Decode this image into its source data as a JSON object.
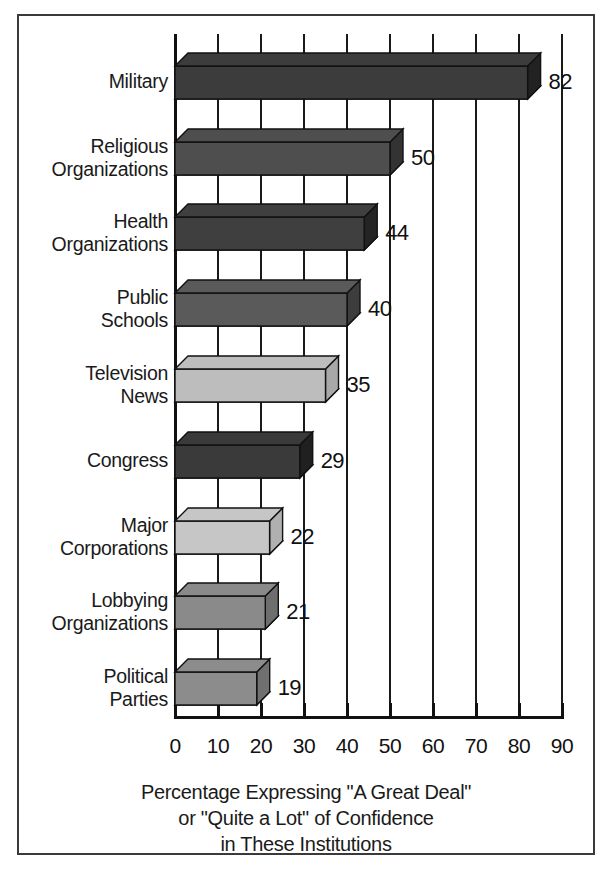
{
  "chart_data": {
    "type": "bar",
    "orientation": "horizontal",
    "title": "",
    "xlabel": "Percentage Expressing \"A Great Deal\" or \"Quite a Lot\" of Confidence in These Institutions",
    "ylabel": "",
    "xlim": [
      0,
      90
    ],
    "grid": true,
    "legend": "none",
    "xticks": [
      "0",
      "10",
      "20",
      "30",
      "40",
      "50",
      "60",
      "70",
      "80",
      "90"
    ],
    "categories": [
      "Military",
      "Religious Organizations",
      "Health Organizations",
      "Public Schools",
      "Television News",
      "Congress",
      "Major Corporations",
      "Lobbying Organizations",
      "Political Parties"
    ],
    "values": [
      82,
      50,
      44,
      40,
      35,
      29,
      22,
      21,
      19
    ],
    "bars": [
      {
        "label_line1": "Military",
        "label_line2": "",
        "value": 82,
        "value_text": "82",
        "fill": "#3c3c3c",
        "side": "#222222"
      },
      {
        "label_line1": "Religious",
        "label_line2": "Organizations",
        "value": 50,
        "value_text": "50",
        "fill": "#4e4e4e",
        "side": "#333333"
      },
      {
        "label_line1": "Health",
        "label_line2": "Organizations",
        "value": 44,
        "value_text": "44",
        "fill": "#3f3f3f",
        "side": "#242424"
      },
      {
        "label_line1": "Public",
        "label_line2": "Schools",
        "value": 40,
        "value_text": "40",
        "fill": "#5a5a5a",
        "side": "#3d3d3d"
      },
      {
        "label_line1": "Television",
        "label_line2": "News",
        "value": 35,
        "value_text": "35",
        "fill": "#bdbdbd",
        "side": "#a8a8a8"
      },
      {
        "label_line1": "Congress",
        "label_line2": "",
        "value": 29,
        "value_text": "29",
        "fill": "#3a3a3a",
        "side": "#202020"
      },
      {
        "label_line1": "Major",
        "label_line2": "Corporations",
        "value": 22,
        "value_text": "22",
        "fill": "#c6c6c6",
        "side": "#b0b0b0"
      },
      {
        "label_line1": "Lobbying",
        "label_line2": "Organizations",
        "value": 21,
        "value_text": "21",
        "fill": "#8a8a8a",
        "side": "#6e6e6e"
      },
      {
        "label_line1": "Political",
        "label_line2": "Parties",
        "value": 19,
        "value_text": "19",
        "fill": "#8c8c8c",
        "side": "#707070"
      }
    ]
  },
  "caption": {
    "line1": "Percentage Expressing \"A Great Deal\"",
    "line2": "or \"Quite a Lot\" of Confidence",
    "line3": "in These Institutions"
  },
  "colors": {
    "axis": "#111111",
    "grid": "#1a1a1a",
    "frame": "#3a3a3a",
    "background": "#ffffff",
    "text": "#1a1a1a"
  }
}
